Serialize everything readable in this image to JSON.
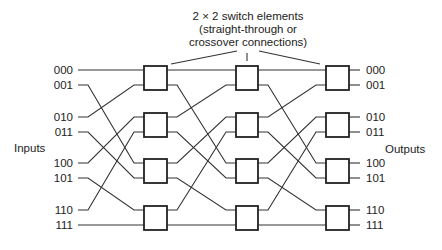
{
  "title_lines": [
    "2 × 2 switch elements",
    "(straight-through or",
    "crossover connections)"
  ],
  "inputs_label": "Inputs",
  "outputs_label": "Outputs",
  "input_labels": [
    "000",
    "001",
    "010",
    "011",
    "100",
    "101",
    "110",
    "111"
  ],
  "output_labels": [
    "000",
    "001",
    "010",
    "011",
    "100",
    "101",
    "110",
    "111"
  ],
  "stages": 3,
  "switches_per_stage": 4,
  "interstage_wiring": "inverse perfect shuffle: position p -> rotate-right(p)",
  "colors": {
    "line": "#333333",
    "box": "#222222",
    "background": "#ffffff"
  }
}
